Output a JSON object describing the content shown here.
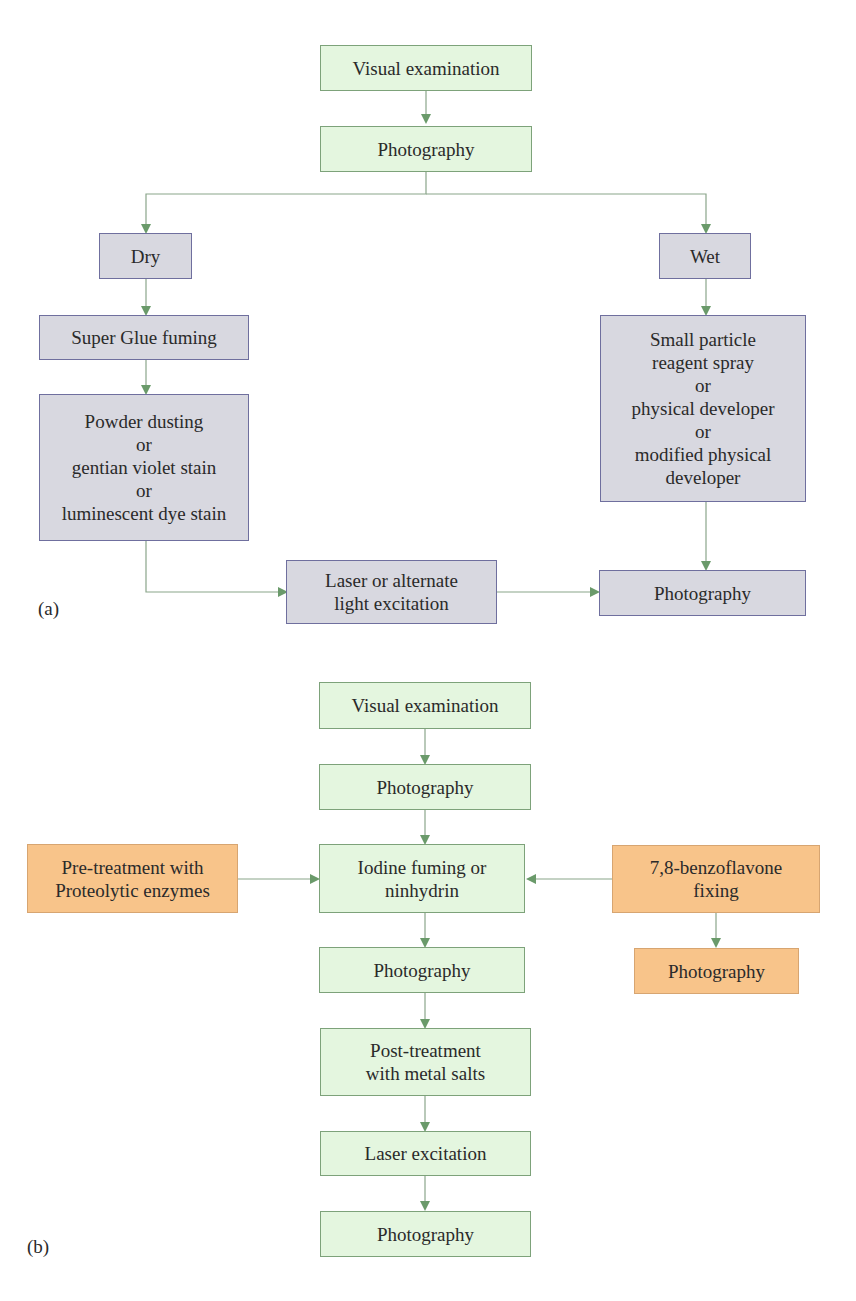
{
  "panel_a": {
    "label": "(a)",
    "nodes": {
      "visual_examination": "Visual examination",
      "photography_1": "Photography",
      "dry": "Dry",
      "wet": "Wet",
      "super_glue": "Super Glue fuming",
      "powder_dusting": "Powder dusting\nor\ngentian violet stain\nor\nluminescent dye stain",
      "small_particle": "Small particle\nreagent spray\nor\nphysical developer\nor\nmodified physical\ndeveloper",
      "laser_alternate": "Laser or alternate\nlight excitation",
      "photography_2": "Photography"
    }
  },
  "panel_b": {
    "label": "(b)",
    "nodes": {
      "visual_examination": "Visual examination",
      "photography_1": "Photography",
      "pretreatment": "Pre-treatment with\nProteolytic enzymes",
      "iodine": "Iodine fuming or\nninhydrin",
      "benzoflavone": "7,8-benzoflavone\nfixing",
      "photography_2": "Photography",
      "photography_orange": "Photography",
      "post_treatment": "Post-treatment\nwith metal salts",
      "laser_excitation": "Laser excitation",
      "photography_3": "Photography"
    }
  },
  "colors": {
    "green_fill": "#e4f6df",
    "grey_fill": "#d8d8e0",
    "orange_fill": "#f8c48a",
    "connector": "#6a9a6a"
  }
}
